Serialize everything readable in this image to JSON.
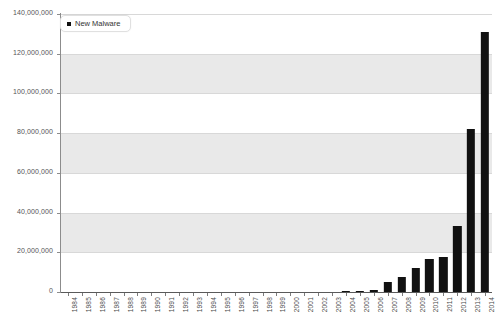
{
  "chart_data": {
    "type": "bar",
    "title": "",
    "xlabel": "",
    "ylabel": "",
    "ylim": [
      0,
      140000000
    ],
    "ytick_step": 20000000,
    "grid": true,
    "legend_position": "top-left",
    "bar_color": "#111111",
    "categories": [
      "1984",
      "1985",
      "1986",
      "1987",
      "1988",
      "1989",
      "1990",
      "1991",
      "1992",
      "1993",
      "1994",
      "1995",
      "1996",
      "1997",
      "1998",
      "1999",
      "2000",
      "2001",
      "2002",
      "2003",
      "2004",
      "2005",
      "2006",
      "2007",
      "2008",
      "2009",
      "2010",
      "2011",
      "2012",
      "2013",
      "2014"
    ],
    "ytick_labels": [
      "0",
      "20,000,000",
      "40,000,000",
      "60,000,000",
      "80,000,000",
      "100,000,000",
      "120,000,000",
      "140,000,000"
    ],
    "ytick_values": [
      0,
      20000000,
      40000000,
      60000000,
      80000000,
      100000000,
      120000000,
      140000000
    ],
    "series": [
      {
        "name": "New Malware",
        "values": [
          0,
          0,
          0,
          0,
          0,
          0,
          0,
          0,
          0,
          0,
          0,
          0,
          0,
          0,
          0,
          0,
          0,
          0,
          0,
          0,
          150000,
          300000,
          900000,
          5000000,
          7500000,
          12000000,
          16500000,
          17500000,
          33000000,
          82000000,
          131000000
        ]
      }
    ]
  },
  "legend": {
    "entries": [
      {
        "label": "New Malware",
        "color": "#111111",
        "marker": "square-marker-icon"
      }
    ]
  }
}
